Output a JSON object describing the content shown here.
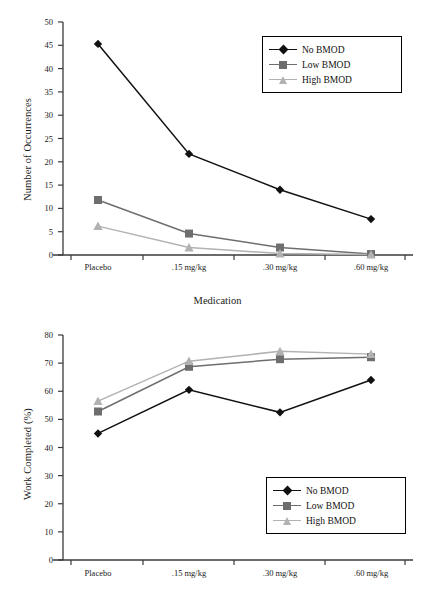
{
  "figure": {
    "series_colors": {
      "no_bmod": "#111111",
      "low_bmod": "#6e6e6e",
      "high_bmod": "#b2b2b2"
    }
  },
  "chart_data": [
    {
      "type": "line",
      "id": "occurrences",
      "title": "",
      "xlabel": "Medication",
      "ylabel": "Number of Occurrences",
      "categories": [
        "Placebo",
        ".15 mg/kg",
        ".30 mg/kg",
        ".60 mg/kg"
      ],
      "ylim": [
        0,
        50
      ],
      "yticks": [
        0,
        5,
        10,
        15,
        20,
        25,
        30,
        35,
        40,
        45,
        50
      ],
      "ytick_labels": [
        "0",
        "5",
        "10",
        "15",
        "20",
        "25",
        "30",
        "35",
        "40",
        "45",
        "50"
      ],
      "grid": false,
      "legend_position": "top-right",
      "series": [
        {
          "name": "No BMOD",
          "marker": "diamond",
          "color": "#111111",
          "values": [
            45.3,
            21.7,
            14.0,
            7.7
          ]
        },
        {
          "name": "Low BMOD",
          "marker": "square",
          "color": "#6e6e6e",
          "values": [
            11.8,
            4.6,
            1.6,
            0.2
          ]
        },
        {
          "name": "High BMOD",
          "marker": "triangle",
          "color": "#b2b2b2",
          "values": [
            6.2,
            1.6,
            0.3,
            0.1
          ]
        }
      ]
    },
    {
      "type": "line",
      "id": "work-completed",
      "title": "",
      "xlabel": "",
      "ylabel": "Work Completed (%)",
      "categories": [
        "Placebo",
        ".15 mg/kg",
        ".30 mg/kg",
        ".60 mg/kg"
      ],
      "ylim": [
        0,
        80
      ],
      "yticks": [
        0,
        10,
        20,
        30,
        40,
        50,
        60,
        70,
        80
      ],
      "ytick_labels": [
        "0",
        "10",
        "20",
        "30",
        "40",
        "50",
        "60",
        "70",
        "80"
      ],
      "grid": false,
      "legend_position": "middle-right",
      "series": [
        {
          "name": "No BMOD",
          "marker": "diamond",
          "color": "#111111",
          "values": [
            45.0,
            60.5,
            52.5,
            64.0
          ]
        },
        {
          "name": "Low BMOD",
          "marker": "square",
          "color": "#6e6e6e",
          "values": [
            52.8,
            68.7,
            71.4,
            72.1
          ]
        },
        {
          "name": "High BMOD",
          "marker": "triangle",
          "color": "#b2b2b2",
          "values": [
            56.5,
            70.7,
            74.2,
            73.2
          ]
        }
      ]
    }
  ]
}
